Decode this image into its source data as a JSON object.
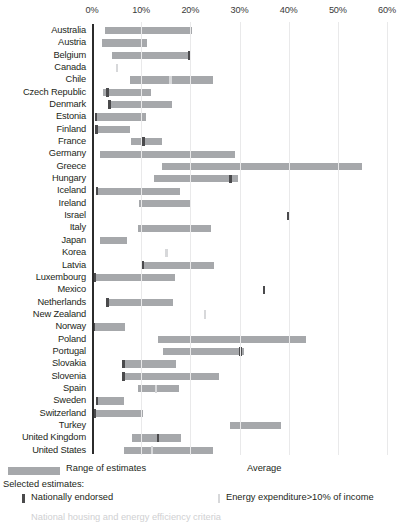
{
  "chart_data": {
    "type": "bar",
    "orientation": "horizontal",
    "title": "",
    "xlabel": "",
    "ylabel": "",
    "xlim": [
      0,
      60
    ],
    "xtick_labels": [
      "0%",
      "10%",
      "20%",
      "30%",
      "40%",
      "50%",
      "60%"
    ],
    "xticks": [
      0,
      10,
      20,
      30,
      40,
      50,
      60
    ],
    "grid": true,
    "categories": [
      "Australia",
      "Austria",
      "Belgium",
      "Canada",
      "Chile",
      "Czech Republic",
      "Denmark",
      "Estonia",
      "Finland",
      "France",
      "Germany",
      "Greece",
      "Hungary",
      "Iceland",
      "Ireland",
      "Israel",
      "Italy",
      "Japan",
      "Korea",
      "Latvia",
      "Luxembourg",
      "Mexico",
      "Netherlands",
      "New Zealand",
      "Norway",
      "Poland",
      "Portugal",
      "Slovakia",
      "Slovenia",
      "Spain",
      "Sweden",
      "Switzerland",
      "Turkey",
      "United Kingdom",
      "United States"
    ],
    "series": [
      {
        "name": "Range of estimates",
        "type": "range",
        "ranges": [
          [
            2.6,
            20.3
          ],
          [
            2.0,
            11.2
          ],
          [
            4.0,
            20.0
          ],
          [
            null,
            null
          ],
          [
            7.8,
            24.6
          ],
          [
            2.3,
            12.0
          ],
          [
            3.5,
            16.3
          ],
          [
            0.6,
            11.0
          ],
          [
            0.7,
            7.8
          ],
          [
            8.0,
            14.3
          ],
          [
            1.6,
            29.0
          ],
          [
            14.3,
            55.0
          ],
          [
            12.7,
            29.7
          ],
          [
            0.8,
            18.0
          ],
          [
            9.6,
            20.0
          ],
          [
            null,
            null
          ],
          [
            9.4,
            24.2
          ],
          [
            1.6,
            7.2
          ],
          [
            null,
            null
          ],
          [
            10.0,
            24.9
          ],
          [
            0.4,
            16.8
          ],
          [
            null,
            null
          ],
          [
            3.0,
            16.4
          ],
          [
            null,
            null
          ],
          [
            0.2,
            6.7
          ],
          [
            13.4,
            43.5
          ],
          [
            14.5,
            31.0
          ],
          [
            6.2,
            17.0
          ],
          [
            6.2,
            25.8
          ],
          [
            9.4,
            17.6
          ],
          [
            0.9,
            6.5
          ],
          [
            0.3,
            10.4
          ],
          [
            28.0,
            38.4
          ],
          [
            8.2,
            18.2
          ],
          [
            6.6,
            24.7
          ]
        ]
      },
      {
        "name": "Nationally endorsed",
        "type": "marker",
        "color": "#4a4a4c",
        "values": [
          null,
          null,
          19.7,
          null,
          null,
          3.1,
          3.6,
          0.8,
          0.9,
          10.5,
          null,
          null,
          28.2,
          1.0,
          null,
          40.0,
          null,
          null,
          null,
          10.4,
          0.5,
          35.0,
          3.2,
          null,
          0.3,
          null,
          30.2,
          6.4,
          6.4,
          null,
          1.0,
          0.5,
          null,
          13.4,
          null
        ]
      },
      {
        "name": "Energy expenditure>10% of income",
        "type": "marker",
        "color": "#d7d8da",
        "values": [
          null,
          null,
          null,
          5.2,
          16.0,
          null,
          null,
          null,
          null,
          null,
          null,
          null,
          null,
          null,
          null,
          null,
          null,
          null,
          15.2,
          null,
          null,
          null,
          null,
          23.0,
          null,
          null,
          null,
          null,
          null,
          13.1,
          null,
          null,
          null,
          null,
          12.2
        ]
      }
    ]
  },
  "axis": {
    "ticks": [
      {
        "label": "0%",
        "value": 0
      },
      {
        "label": "10%",
        "value": 10
      },
      {
        "label": "20%",
        "value": 20
      },
      {
        "label": "30%",
        "value": 30
      },
      {
        "label": "40%",
        "value": 40
      },
      {
        "label": "50%",
        "value": 50
      },
      {
        "label": "60%",
        "value": 60
      }
    ]
  },
  "legend": {
    "range_label": "Range of estimates",
    "average_label": "Average",
    "selected_title": "Selected estimates:",
    "nationally_endorsed_label": "Nationally endorsed",
    "energy_expenditure_label": "Energy expenditure>10% of income",
    "clipped_label": "National housing and energy efficiency criteria"
  },
  "colors": {
    "bar": "#a6a8ab",
    "marker_dark": "#4a4a4c",
    "marker_light": "#d7d8da",
    "axis": "#2b2b2b",
    "grid": "#e9e9ea",
    "text": "#231f20"
  }
}
